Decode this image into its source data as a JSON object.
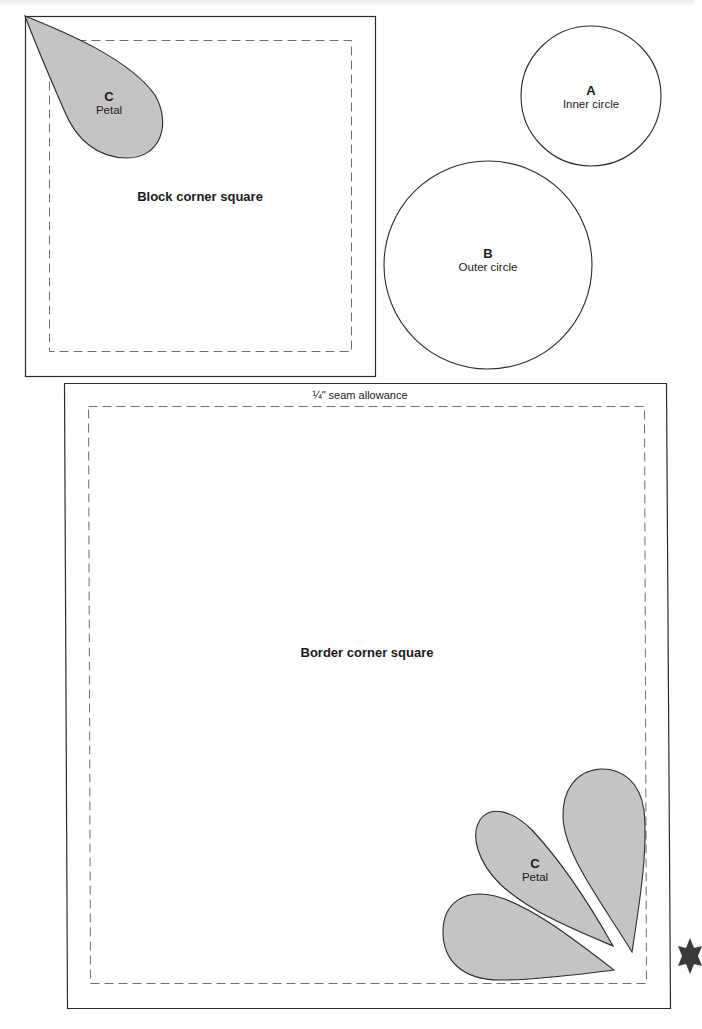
{
  "pieces": {
    "block_square": {
      "title": "Block corner square"
    },
    "border_square": {
      "title": "Border corner square",
      "seam_label": "¼\" seam allowance"
    },
    "circle_a": {
      "letter": "A",
      "name": "Inner circle"
    },
    "circle_b": {
      "letter": "B",
      "name": "Outer circle"
    },
    "petal_block": {
      "letter": "C",
      "name": "Petal"
    },
    "petal_border": {
      "letter": "C",
      "name": "Petal"
    }
  },
  "colors": {
    "outline": "#2b2b2b",
    "dashed": "#6f6f6f",
    "petal_fill": "#c4c4c4",
    "paper": "#ffffff"
  },
  "icons": {
    "corner_mark": "star-icon"
  }
}
